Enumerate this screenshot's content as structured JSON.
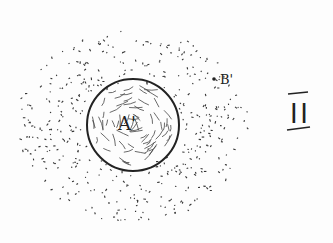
{
  "diagram": {
    "sphere_label": "A'",
    "point_label": "B'",
    "figure_number": "II",
    "colors": {
      "ink": "#222222",
      "background": "#fdfdfd"
    }
  }
}
